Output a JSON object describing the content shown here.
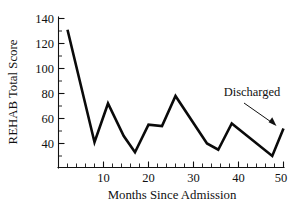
{
  "chart_data": {
    "type": "line",
    "title": "",
    "xlabel": "Months Since Admission",
    "ylabel": "REHAB Total Score",
    "xlim": [
      0,
      51
    ],
    "ylim": [
      22,
      145
    ],
    "grid": false,
    "legend": null,
    "x_ticks_major": [
      10,
      20,
      30,
      40,
      50
    ],
    "x_tick_labels": [
      "10",
      "20",
      "30",
      "40",
      "50"
    ],
    "x_ticks_minor": [
      2,
      4,
      6,
      8,
      12,
      14,
      16,
      18,
      22,
      24,
      26,
      28,
      32,
      34,
      36,
      38,
      42,
      44,
      46,
      48
    ],
    "y_ticks_major": [
      40,
      60,
      80,
      100,
      120,
      140
    ],
    "y_tick_labels": [
      "40",
      "60",
      "80",
      "100",
      "120",
      "140"
    ],
    "y_ticks_minor": [
      30,
      50,
      70,
      90,
      110,
      130
    ],
    "series": [
      {
        "name": "REHAB Total Score",
        "color": "#0a0a0a",
        "x": [
          2,
          8,
          11,
          14.5,
          17,
          20,
          23,
          26,
          33,
          35.5,
          38.5,
          47.5,
          50
        ],
        "y": [
          131,
          41,
          72,
          46,
          33,
          55,
          54,
          78,
          40,
          35,
          56,
          30,
          52
        ]
      }
    ],
    "annotations": [
      {
        "label": "Discharged",
        "target_x": 50,
        "target_y": 52
      }
    ]
  }
}
